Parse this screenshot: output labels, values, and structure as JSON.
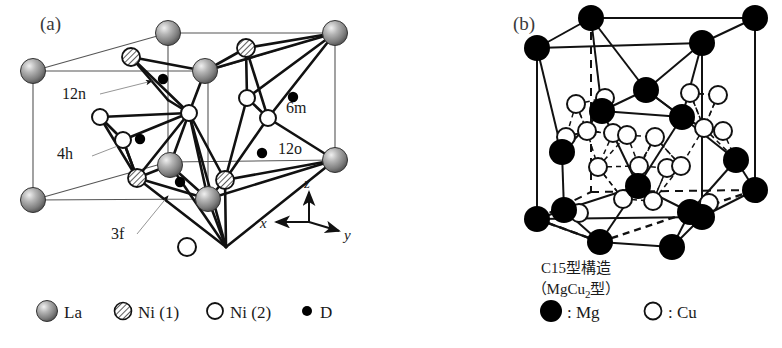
{
  "figure": {
    "background": "#ffffff",
    "width": 782,
    "height": 348
  },
  "panel_a": {
    "label": "(a)",
    "structure_name": "LaNi5 deuteride hexagonal cell",
    "site_labels": [
      {
        "name": "12n",
        "text": "12n",
        "x": 62,
        "y": 99
      },
      {
        "name": "6m",
        "text": "6m",
        "x": 286,
        "y": 113
      },
      {
        "name": "4h",
        "text": "4h",
        "x": 57,
        "y": 159
      },
      {
        "name": "12o",
        "text": "12o",
        "x": 278,
        "y": 154
      },
      {
        "name": "3f",
        "text": "3f",
        "x": 111,
        "y": 239
      }
    ],
    "axes": {
      "x": "x",
      "y": "y",
      "z": "z"
    }
  },
  "panel_b": {
    "label": "(b)",
    "caption_line1": "C15型構造",
    "caption_line2_open": "（MgCu",
    "caption_line2_sub": "2",
    "caption_line2_close": "型）"
  },
  "legend_a": {
    "items": [
      {
        "name": "la",
        "symbol": "sphere-gray",
        "text": "La"
      },
      {
        "name": "ni1",
        "symbol": "circle-hatched",
        "text": "Ni (1)"
      },
      {
        "name": "ni2",
        "symbol": "circle-open",
        "text": "Ni (2)"
      },
      {
        "name": "d",
        "symbol": "dot-filled",
        "text": "D"
      }
    ]
  },
  "legend_b": {
    "items": [
      {
        "name": "mg",
        "symbol": "circle-filled",
        "text": ": Mg"
      },
      {
        "name": "cu",
        "symbol": "circle-open",
        "text": ": Cu"
      }
    ]
  },
  "colors": {
    "line": "#1a1a1a",
    "thin_line": "#555555",
    "sphere_light": "#e8e8e8",
    "sphere_mid": "#9a9a9a",
    "sphere_dark": "#4a4a4a",
    "black": "#000000",
    "white": "#ffffff",
    "text": "#1a1a1a"
  }
}
